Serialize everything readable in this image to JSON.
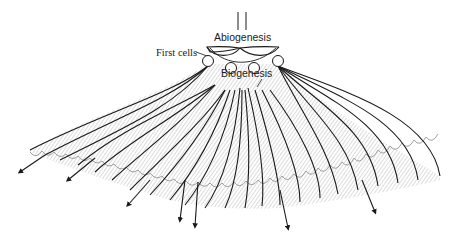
{
  "diagram": {
    "type": "phylogenetic-branching-illustration",
    "labels": {
      "abiogenesis": "Abiogenesis",
      "first_cells": "First cells",
      "biogenesis": "Biogenesis"
    },
    "colors": {
      "line": "#1a1a1a",
      "hatch": "#8a8a8a",
      "background": "#ffffff"
    },
    "first_cells_count": 4,
    "arrow_count": 7
  }
}
